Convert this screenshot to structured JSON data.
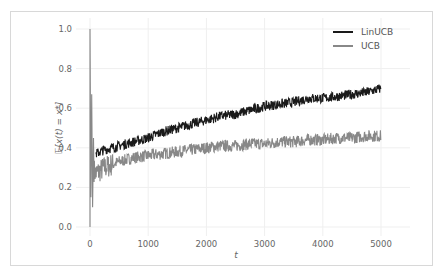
{
  "chart_data": {
    "type": "line",
    "title": "",
    "xlabel": "t",
    "ylabel": "E[x(t) = x*]",
    "xlim": [
      -250,
      5250
    ],
    "ylim": [
      -0.05,
      1.05
    ],
    "xticks": [
      0,
      1000,
      2000,
      3000,
      4000,
      5000
    ],
    "xtick_labels": [
      "0",
      "1000",
      "2000",
      "3000",
      "4000",
      "5000"
    ],
    "yticks": [
      0.0,
      0.2,
      0.4,
      0.6,
      0.8,
      1.0
    ],
    "ytick_labels": [
      "0.0",
      "0.2",
      "0.4",
      "0.6",
      "0.8",
      "1.0"
    ],
    "grid": true,
    "legend_position": "upper right",
    "series": [
      {
        "name": "LinUCB",
        "color": "#1a1a1a",
        "x": [
          100,
          250,
          500,
          750,
          1000,
          1250,
          1500,
          1750,
          2000,
          2250,
          2500,
          2750,
          3000,
          3250,
          3500,
          3750,
          4000,
          4250,
          4500,
          4750,
          5000
        ],
        "values": [
          0.37,
          0.39,
          0.41,
          0.43,
          0.45,
          0.48,
          0.5,
          0.52,
          0.54,
          0.56,
          0.57,
          0.59,
          0.61,
          0.62,
          0.63,
          0.65,
          0.65,
          0.66,
          0.67,
          0.68,
          0.7
        ]
      },
      {
        "name": "UCB",
        "color": "#888888",
        "x": [
          0,
          20,
          50,
          100,
          250,
          500,
          750,
          1000,
          1250,
          1500,
          1750,
          2000,
          2250,
          2500,
          2750,
          3000,
          3250,
          3500,
          3750,
          4000,
          4250,
          4500,
          4750,
          5000
        ],
        "values": [
          1.0,
          0.05,
          0.3,
          0.27,
          0.3,
          0.33,
          0.35,
          0.36,
          0.37,
          0.38,
          0.39,
          0.4,
          0.41,
          0.41,
          0.42,
          0.42,
          0.43,
          0.43,
          0.44,
          0.44,
          0.45,
          0.45,
          0.46,
          0.46
        ]
      }
    ]
  },
  "legend": {
    "items": [
      {
        "label": "LinUCB",
        "color": "#1a1a1a"
      },
      {
        "label": "UCB",
        "color": "#888888"
      }
    ]
  },
  "axes": {
    "xlabel": "t",
    "ylabel": "E[x(t) = x*]"
  }
}
